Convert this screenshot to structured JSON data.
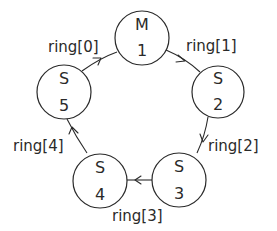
{
  "diagram": {
    "type": "ring-topology",
    "nodes": [
      {
        "role": "M",
        "id": "1",
        "cx": 142,
        "cy": 38,
        "r": 27
      },
      {
        "role": "S",
        "id": "2",
        "cx": 218,
        "cy": 92,
        "r": 26
      },
      {
        "role": "S",
        "id": "3",
        "cx": 179,
        "cy": 180,
        "r": 27
      },
      {
        "role": "S",
        "id": "4",
        "cx": 100,
        "cy": 181,
        "r": 27
      },
      {
        "role": "S",
        "id": "5",
        "cx": 64,
        "cy": 92,
        "r": 27
      }
    ],
    "edges": [
      {
        "label": "ring[1]",
        "from": "1",
        "to": "2"
      },
      {
        "label": "ring[2]",
        "from": "2",
        "to": "3"
      },
      {
        "label": "ring[3]",
        "from": "3",
        "to": "4"
      },
      {
        "label": "ring[4]",
        "from": "4",
        "to": "5"
      },
      {
        "label": "ring[0]",
        "from": "5",
        "to": "1"
      }
    ]
  }
}
